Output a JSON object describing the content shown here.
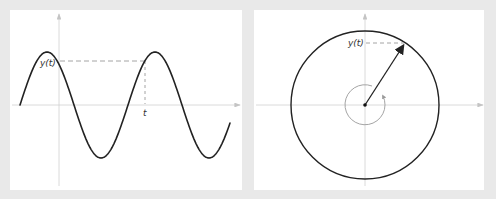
{
  "figure": {
    "left_panel": {
      "title": "Sine wave in time domain",
      "labels": {
        "y_value": "y(t)",
        "time": "t"
      },
      "waveform": {
        "type": "sine",
        "amplitude_px": 53,
        "period_px": 108,
        "phase_description": "starts at zero crossing rising"
      }
    },
    "right_panel": {
      "title": "Rotating phasor",
      "labels": {
        "y_value": "y(t)"
      },
      "rotation_direction": "counterclockwise"
    },
    "colors": {
      "background": "#e9e9e9",
      "panel": "#ffffff",
      "curve": "#222222",
      "axis": "#cccccc",
      "dashed": "#999999"
    }
  }
}
